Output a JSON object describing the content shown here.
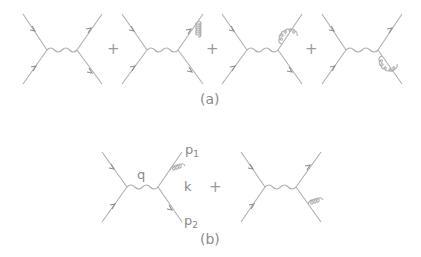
{
  "figure": {
    "row_a": {
      "caption": "(a)",
      "diagrams": [
        {
          "name": "tree-level",
          "correction": "none"
        },
        {
          "name": "vertex-correction",
          "correction": "gluon exchanged between outgoing quark and antiquark"
        },
        {
          "name": "self-energy-upper",
          "correction": "gluon loop on upper outgoing line"
        },
        {
          "name": "self-energy-lower",
          "correction": "gluon loop on lower outgoing line"
        }
      ],
      "operators": [
        "+",
        "+",
        "+"
      ]
    },
    "row_b": {
      "caption": "(b)",
      "diagrams": [
        {
          "name": "real-emission-upper",
          "correction": "gluon emitted from upper outgoing line"
        },
        {
          "name": "real-emission-lower",
          "correction": "gluon emitted from lower outgoing line"
        }
      ],
      "operators": [
        "+"
      ],
      "labels": {
        "photon_momentum": "q",
        "p1_main": "p",
        "p1_sub": "1",
        "gluon_momentum": "k",
        "p2_main": "p",
        "p2_sub": "2"
      }
    },
    "line_color": "#a8a8a8"
  }
}
